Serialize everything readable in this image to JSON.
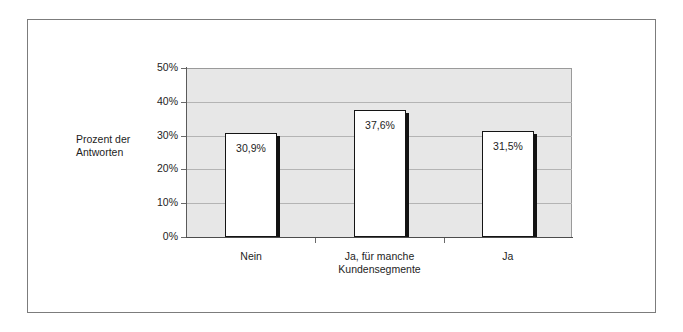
{
  "figure": {
    "background_color": "#ffffff",
    "frame_color": "#7c7c7c",
    "plot_background_color": "#e7e7e7",
    "gridline_color": "#b4b4b4",
    "bar_fill_color": "#ffffff",
    "bar_outline_color": "#141414",
    "bar_shadow_color": "#121212",
    "axis_title": "Prozent der\nAntworten"
  },
  "chart_data": {
    "type": "bar",
    "title": "",
    "subtitle": "",
    "xlabel": "",
    "ylabel": "Prozent der Antworten",
    "categories": [
      "Nein",
      "Ja, für manche\nKundensegmente",
      "Ja"
    ],
    "values": [
      30.9,
      37.6,
      31.5
    ],
    "data_labels": [
      "30,9%",
      "37,6%",
      "31,5%"
    ],
    "ylim": [
      0,
      50
    ],
    "ytick_values": [
      0,
      10,
      20,
      30,
      40,
      50
    ],
    "ytick_labels": [
      "0%",
      "10%",
      "20%",
      "30%",
      "40%",
      "50%"
    ],
    "grid": true,
    "grid_axis": "y",
    "legend": false,
    "legend_position": "none",
    "series": [
      {
        "name": "Prozent der Antworten",
        "values": [
          30.9,
          37.6,
          31.5
        ]
      }
    ]
  }
}
